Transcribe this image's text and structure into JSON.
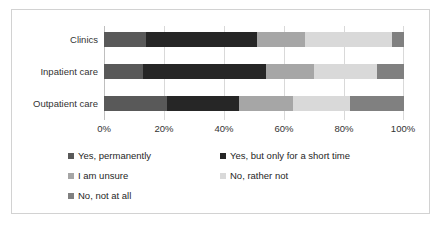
{
  "chart_data": {
    "type": "bar",
    "orientation": "horizontal",
    "stacked": "percent",
    "title": "",
    "subtitle": "",
    "xlabel": "",
    "ylabel": "",
    "xlim": [
      0,
      100
    ],
    "grid": true,
    "legend_position": "bottom",
    "categories": [
      "Clinics",
      "Inpatient care",
      "Outpatient care"
    ],
    "tick_labels": [
      "0%",
      "20%",
      "40%",
      "60%",
      "80%",
      "100%"
    ],
    "tick_values": [
      0,
      20,
      40,
      60,
      80,
      100
    ],
    "series": [
      {
        "name": "Yes, permanently",
        "color": "#595959",
        "values": [
          14,
          13,
          21
        ]
      },
      {
        "name": "Yes, but only for a short time",
        "color": "#262626",
        "values": [
          37,
          41,
          24
        ]
      },
      {
        "name": "I am unsure",
        "color": "#a6a6a6",
        "values": [
          16,
          16,
          18
        ]
      },
      {
        "name": "No, rather not",
        "color": "#d9d9d9",
        "values": [
          29,
          21,
          19
        ]
      },
      {
        "name": "No, not at all",
        "color": "#808080",
        "values": [
          4,
          9,
          18
        ]
      }
    ]
  },
  "legend": {
    "rows": [
      [
        "Yes, permanently",
        "Yes, but only for a short time"
      ],
      [
        "I am unsure",
        "No, rather not"
      ],
      [
        "No, not at all"
      ]
    ]
  },
  "colors": {
    "frame_border": "#d2d2d2",
    "gridline": "#d9d9d9",
    "axis": "#bfbfbf",
    "text": "#262626",
    "background": "#ffffff"
  }
}
